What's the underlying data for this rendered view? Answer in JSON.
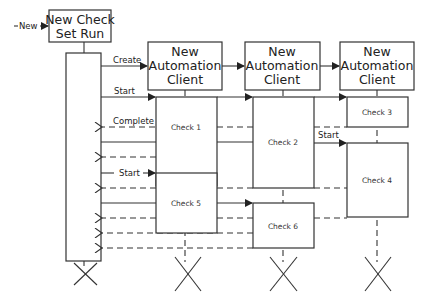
{
  "diagram": {
    "type": "sequence-diagram",
    "entry_label": "New",
    "initiator": {
      "line1": "New Check",
      "line2": "Set Run"
    },
    "participants": [
      {
        "line1": "New",
        "line2": "Automation",
        "line3": "Client"
      },
      {
        "line1": "New",
        "line2": "Automation",
        "line3": "Client"
      },
      {
        "line1": "New",
        "line2": "Automation",
        "line3": "Client"
      }
    ],
    "messages": {
      "create": "Create",
      "start1": "Start",
      "complete": "Complete",
      "start_check4": "Start",
      "start_check5": "Start"
    },
    "checks": [
      "Check 1",
      "Check 2",
      "Check 3",
      "Check 4",
      "Check 5",
      "Check 6"
    ],
    "colors": {
      "stroke": "#333333",
      "background": "#ffffff",
      "text": "#222222"
    }
  }
}
